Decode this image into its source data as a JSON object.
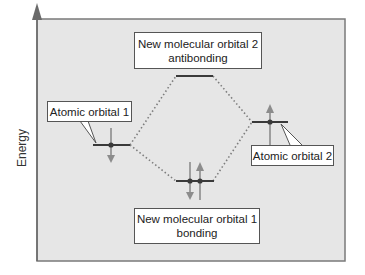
{
  "diagram": {
    "type": "molecular-orbital-energy-diagram",
    "axis": {
      "label": "Energy",
      "direction": "up"
    },
    "labels": {
      "atomic_orbital_1": "Atomic orbital 1",
      "atomic_orbital_2": "Atomic orbital 2",
      "molecular_orbital_2_line1": "New molecular orbital 2",
      "molecular_orbital_2_line2": "antibonding",
      "molecular_orbital_1_line1": "New molecular orbital 1",
      "molecular_orbital_1_line2": "bonding"
    },
    "orbitals": [
      {
        "name": "atomic-orbital-1",
        "level": "middle",
        "electrons": 1,
        "spin": "down"
      },
      {
        "name": "atomic-orbital-2",
        "level": "middle",
        "electrons": 1,
        "spin": "up"
      },
      {
        "name": "molecular-orbital-2-antibonding",
        "level": "high",
        "electrons": 0
      },
      {
        "name": "molecular-orbital-1-bonding",
        "level": "low",
        "electrons": 2,
        "spins": [
          "down",
          "up"
        ]
      }
    ],
    "colors": {
      "panel_background": "#e6e6e6",
      "frame": "#6a6a6a",
      "orbital_line": "#3a3a3a",
      "electron_arrow": "#8c8c8c",
      "dotted_connector": "#808080",
      "label_border": "#555555"
    }
  }
}
